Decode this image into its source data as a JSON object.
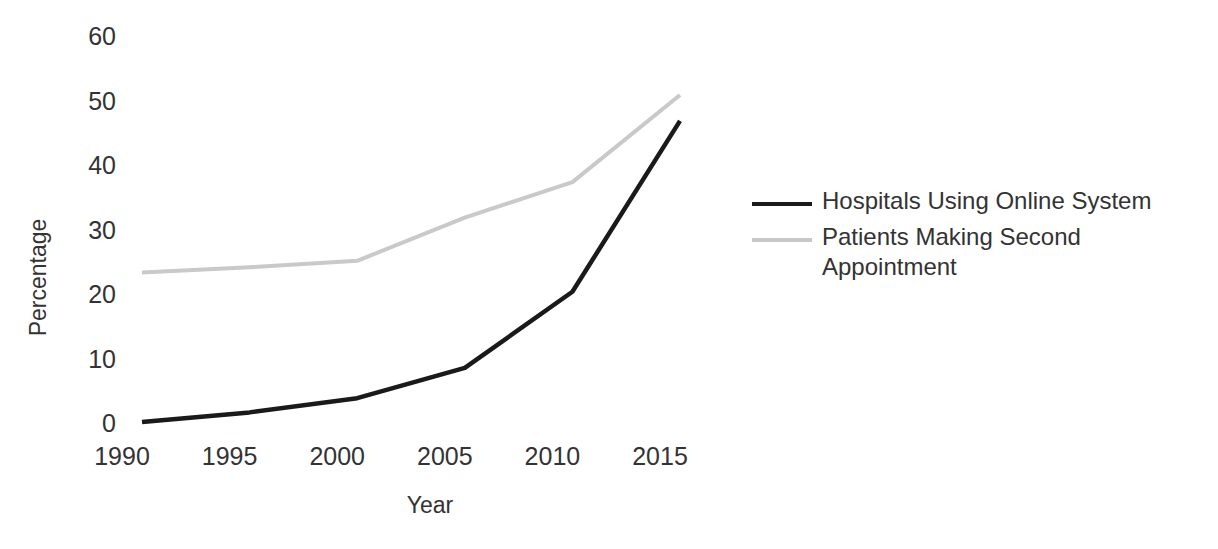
{
  "chart_data": {
    "type": "line",
    "title": "",
    "xlabel": "Year",
    "ylabel": "Percentage",
    "x": [
      1990,
      1995,
      2000,
      2005,
      2010,
      2015
    ],
    "xtick_labels": [
      "1990",
      "1995",
      "2000",
      "2005",
      "2010",
      "2015"
    ],
    "ytick_labels": [
      "0",
      "10",
      "20",
      "30",
      "40",
      "50",
      "60"
    ],
    "ytick_values": [
      0,
      10,
      20,
      30,
      40,
      50,
      60
    ],
    "xlim": [
      1990,
      2015
    ],
    "ylim": [
      0,
      60
    ],
    "grid": false,
    "legend_position": "right",
    "series": [
      {
        "name": "Hospitals Using Online System",
        "color": "#1a1a1a",
        "values": [
          0.3,
          1.8,
          4.0,
          8.7,
          20.5,
          47.0
        ]
      },
      {
        "name": "Patients Making Second Appointment",
        "color": "#c9c9c9",
        "values": [
          23.5,
          24.3,
          25.3,
          32.0,
          37.5,
          51.0
        ]
      }
    ]
  },
  "axes": {
    "y_title": "Percentage",
    "x_title": "Year"
  },
  "legend": {
    "entries": [
      {
        "label": "Hospitals Using Online System"
      },
      {
        "label": "Patients Making Second Appointment"
      }
    ]
  }
}
